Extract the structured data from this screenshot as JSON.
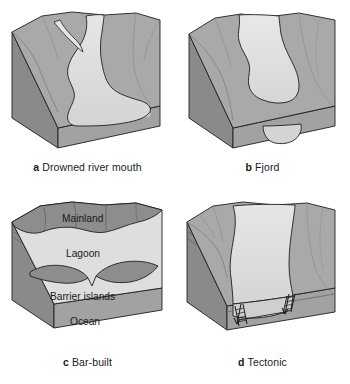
{
  "figure": {
    "background_color": "#ffffff",
    "panel_count": 4
  },
  "colors": {
    "land_top": "#a9a9a9",
    "land_dark": "#8d8d8d",
    "land_shadow": "#7e7e7e",
    "water": "#dedede",
    "water_deep": "#d2d2d2",
    "block_front": "#a2a2a2",
    "block_side": "#8a8a8a",
    "outline": "#1f1f1f",
    "text": "#1a1a1a"
  },
  "panels": [
    {
      "id": "a",
      "letter": "a",
      "label": "Drowned river mouth",
      "description": "Block diagram of a drowned river valley estuary with a branching dendritic channel widening seaward",
      "internal_labels": []
    },
    {
      "id": "b",
      "letter": "b",
      "label": "Fjord",
      "description": "Block diagram of a glacially carved fjord with a narrow sinuous river entering a deep U-shaped basin",
      "internal_labels": []
    },
    {
      "id": "c",
      "letter": "c",
      "label": "Bar-built",
      "description": "Block diagram of a bar-built estuary with a lagoon separated from the ocean by barrier islands",
      "internal_labels": [
        {
          "text": "Mainland",
          "x": 62,
          "y": 30
        },
        {
          "text": "Lagoon",
          "x": 66,
          "y": 65
        },
        {
          "text": "Barrier islands",
          "x": 50,
          "y": 108
        },
        {
          "text": "Ocean",
          "x": 70,
          "y": 133
        }
      ]
    },
    {
      "id": "d",
      "letter": "d",
      "label": "Tectonic",
      "description": "Block diagram of a tectonic estuary formed in a down-faulted graben with fault arrows in the cross section",
      "internal_labels": []
    }
  ]
}
